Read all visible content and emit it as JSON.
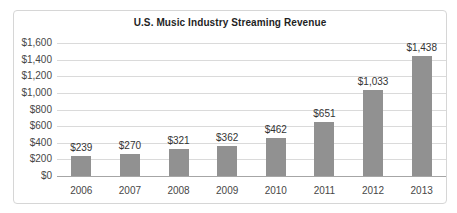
{
  "chart_data": {
    "type": "bar",
    "title": "U.S. Music Industry Streaming Revenue",
    "categories": [
      "2006",
      "2007",
      "2008",
      "2009",
      "2010",
      "2011",
      "2012",
      "2013"
    ],
    "values": [
      239,
      270,
      321,
      362,
      462,
      651,
      1033,
      1438
    ],
    "value_labels": [
      "$239",
      "$270",
      "$321",
      "$362",
      "$462",
      "$651",
      "$1,033",
      "$1,438"
    ],
    "xlabel": "",
    "ylabel": "",
    "ylim": [
      0,
      1600
    ],
    "ytick_step": 200,
    "ytick_labels": [
      "$0",
      "$200",
      "$400",
      "$600",
      "$800",
      "$1,000",
      "$1,200",
      "$1,400",
      "$1,600"
    ],
    "grid": true,
    "legend": "none",
    "colors": {
      "bar": "#919191",
      "gridline": "#dadada",
      "axis_line": "#a6a6a6",
      "title_text": "#1f1f1f",
      "tick_text": "#474747",
      "value_label_text": "#333333",
      "frame_border": "#d6d6d6",
      "background": "#ffffff"
    }
  }
}
